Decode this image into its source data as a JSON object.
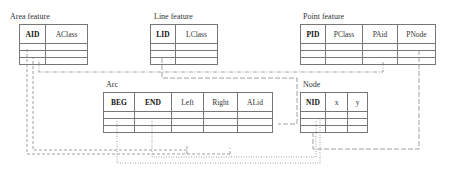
{
  "diagram": {
    "type": "entity-relationship schema",
    "tables": [
      {
        "id": "area",
        "title": "Area feature",
        "columns": [
          {
            "label": "AID",
            "key": true
          },
          {
            "label": "AClass",
            "key": false
          }
        ],
        "empty_rows": 3
      },
      {
        "id": "line",
        "title": "Line feature",
        "columns": [
          {
            "label": "LID",
            "key": true
          },
          {
            "label": "LClass",
            "key": false
          }
        ],
        "empty_rows": 3
      },
      {
        "id": "point",
        "title": "Point feature",
        "columns": [
          {
            "label": "PID",
            "key": true
          },
          {
            "label": "PClass",
            "key": false
          },
          {
            "label": "PAid",
            "key": false
          },
          {
            "label": "PNode",
            "key": false
          }
        ],
        "empty_rows": 3
      },
      {
        "id": "arc",
        "title": "Arc",
        "columns": [
          {
            "label": "BEG",
            "key": true
          },
          {
            "label": "END",
            "key": true
          },
          {
            "label": "Left",
            "key": false
          },
          {
            "label": "Right",
            "key": false
          },
          {
            "label": "ALid",
            "key": false
          }
        ],
        "empty_rows": 3
      },
      {
        "id": "node",
        "title": "Node",
        "columns": [
          {
            "label": "NID",
            "key": true
          },
          {
            "label": "x",
            "key": false
          },
          {
            "label": "y",
            "key": false
          }
        ],
        "empty_rows": 3
      }
    ],
    "links": [
      {
        "from": "arc.Left",
        "to": "area.AID",
        "style": "dashed"
      },
      {
        "from": "arc.Right",
        "to": "area.AID",
        "style": "dashed"
      },
      {
        "from": "point.PAid",
        "to": "area.AID",
        "style": "dash-dot"
      },
      {
        "from": "arc.ALid",
        "to": "line.LID",
        "style": "long-dash"
      },
      {
        "from": "point.PNode",
        "to": "node.NID",
        "style": "long-dash"
      },
      {
        "from": "arc.BEG",
        "to": "node.NID",
        "style": "dotted"
      },
      {
        "from": "arc.END",
        "to": "node.NID",
        "style": "dotted"
      }
    ],
    "colors": {
      "border": "#777777",
      "link": "#888888",
      "text": "#333333"
    }
  }
}
